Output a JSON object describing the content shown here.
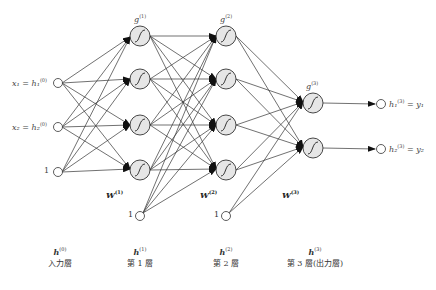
{
  "diagram": {
    "type": "feedforward-neural-network",
    "inputs": [
      {
        "label": "x₁ = h₁",
        "sup": "(0)"
      },
      {
        "label": "x₂ = h₂",
        "sup": "(0)"
      },
      {
        "label": "1",
        "sup": ""
      }
    ],
    "activations": {
      "layer1": {
        "label": "g",
        "sup": "(1)"
      },
      "layer2": {
        "label": "g",
        "sup": "(2)"
      },
      "layer3": {
        "label": "g",
        "sup": "(3)"
      }
    },
    "weights": [
      {
        "label": "W",
        "sup": "(1)"
      },
      {
        "label": "W",
        "sup": "(2)"
      },
      {
        "label": "W",
        "sup": "(3)"
      }
    ],
    "bias_labels": [
      "1",
      "1"
    ],
    "outputs": [
      {
        "label": "h₁",
        "sup": "(3)",
        "eq": "= y₁"
      },
      {
        "label": "h₂",
        "sup": "(3)",
        "eq": "= y₂"
      }
    ],
    "layer_captions": [
      {
        "h": "h",
        "sup": "(0)",
        "name": "入力層"
      },
      {
        "h": "h",
        "sup": "(1)",
        "name": "第 1 層"
      },
      {
        "h": "h",
        "sup": "(2)",
        "name": "第 2 層"
      },
      {
        "h": "h",
        "sup": "(3)",
        "name": "第 3 層(出力層)"
      }
    ],
    "colors": {
      "node_fill": "#e6e6e6",
      "stroke": "#333333",
      "background": "#ffffff"
    }
  }
}
